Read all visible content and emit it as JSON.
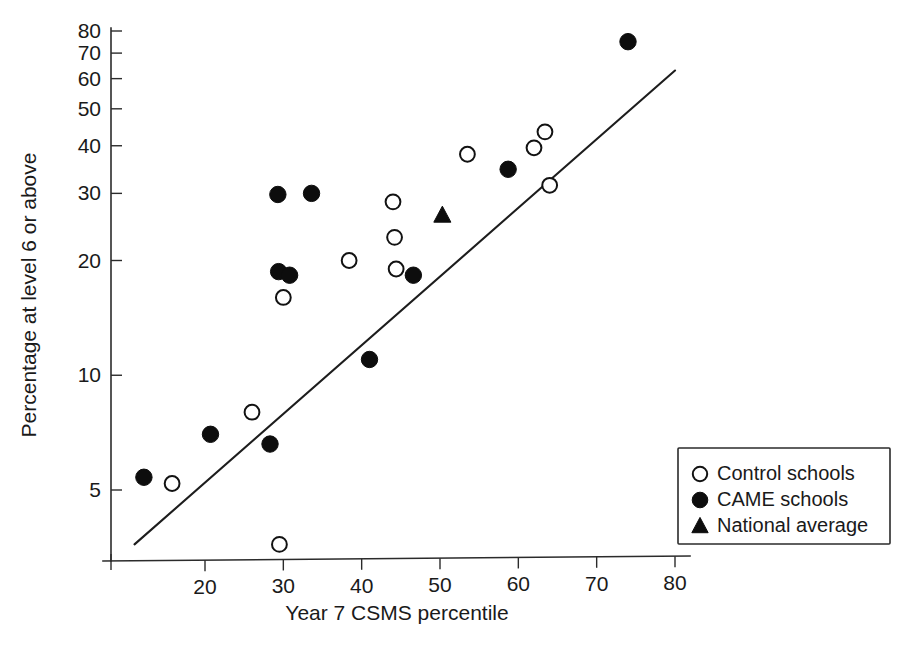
{
  "chart_data": {
    "type": "scatter",
    "title": "",
    "subtitle": "",
    "xlabel": "Year 7 CSMS percentile",
    "ylabel": "Percentage at level 6 or above",
    "xlim": [
      10,
      82
    ],
    "ylim": [
      3,
      85
    ],
    "yscale": "log",
    "xscale": "linear",
    "grid": false,
    "xticks": [
      20,
      30,
      40,
      50,
      60,
      70,
      80
    ],
    "xtick_labels": [
      "20",
      "30",
      "40",
      "50",
      "60",
      "70",
      "80"
    ],
    "yticks": [
      5,
      10,
      20,
      30,
      40,
      50,
      60,
      70,
      80
    ],
    "ytick_labels": [
      "5",
      "10",
      "20",
      "30",
      "40",
      "50",
      "60",
      "70",
      "80"
    ],
    "legend_position": "bottom-right",
    "legend_entries": [
      {
        "label": "Control schools",
        "marker": "open-circle"
      },
      {
        "label": "CAME schools",
        "marker": "filled-circle"
      },
      {
        "label": "National average",
        "marker": "filled-triangle"
      }
    ],
    "series": [
      {
        "name": "Control schools",
        "marker": "open-circle",
        "points": [
          {
            "x": 15.8,
            "y": 5.2
          },
          {
            "x": 26.0,
            "y": 8.0
          },
          {
            "x": 29.5,
            "y": 3.6
          },
          {
            "x": 30.0,
            "y": 16.0
          },
          {
            "x": 38.4,
            "y": 20.0
          },
          {
            "x": 44.0,
            "y": 28.5
          },
          {
            "x": 44.2,
            "y": 23.0
          },
          {
            "x": 44.4,
            "y": 19.0
          },
          {
            "x": 53.5,
            "y": 38.0
          },
          {
            "x": 62.0,
            "y": 39.5
          },
          {
            "x": 63.4,
            "y": 43.5
          },
          {
            "x": 64.0,
            "y": 31.5
          }
        ]
      },
      {
        "name": "CAME schools",
        "marker": "filled-circle",
        "points": [
          {
            "x": 12.2,
            "y": 5.4
          },
          {
            "x": 20.7,
            "y": 7.0
          },
          {
            "x": 28.3,
            "y": 6.6
          },
          {
            "x": 29.3,
            "y": 29.8
          },
          {
            "x": 29.4,
            "y": 18.7
          },
          {
            "x": 30.8,
            "y": 18.3
          },
          {
            "x": 33.6,
            "y": 30.0
          },
          {
            "x": 41.0,
            "y": 11.0
          },
          {
            "x": 46.6,
            "y": 18.3
          },
          {
            "x": 58.7,
            "y": 34.7
          },
          {
            "x": 74.0,
            "y": 75.0
          }
        ]
      },
      {
        "name": "National average",
        "marker": "filled-triangle",
        "points": [
          {
            "x": 50.3,
            "y": 26.3
          }
        ]
      }
    ],
    "trend_line": {
      "name": "regression line",
      "x_start": 11.0,
      "y_start": 3.6,
      "x_end": 80.0,
      "y_end": 63.0
    }
  }
}
